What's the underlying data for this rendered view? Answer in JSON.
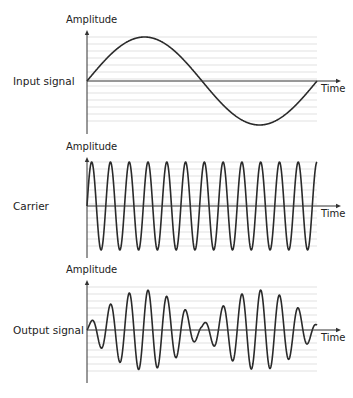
{
  "panels": [
    {
      "id": "input",
      "side_label": "Input signal",
      "y_label": "Amplitude",
      "x_label": "Time",
      "origin_y": 81,
      "axis_top": 30,
      "axis_bottom": 134,
      "grid_top": 37,
      "grid_bottom": 126,
      "amplitude_px": 44,
      "waveform": "sine",
      "cycles": 1
    },
    {
      "id": "carrier",
      "side_label": "Carrier",
      "y_label": "Amplitude",
      "x_label": "Time",
      "origin_y": 206,
      "axis_top": 157,
      "axis_bottom": 258,
      "grid_top": 162,
      "grid_bottom": 251,
      "amplitude_px": 44,
      "waveform": "carrier",
      "cycles": 12.25
    },
    {
      "id": "output",
      "side_label": "Output signal",
      "y_label": "Amplitude",
      "x_label": "Time",
      "origin_y": 330,
      "axis_top": 280,
      "axis_bottom": 383,
      "grid_top": 287,
      "grid_bottom": 376,
      "amplitude_px": 40,
      "waveform": "modulated",
      "cycles": 12.25
    }
  ],
  "layout": {
    "x_start": 87,
    "x_end": 317,
    "arrow_end": 341,
    "grid_spacing": 7
  },
  "colors": {
    "line": "#2a2a2a",
    "grid": "#d9d9d9",
    "axis": "#333333"
  }
}
